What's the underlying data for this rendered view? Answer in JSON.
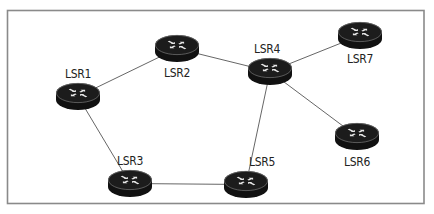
{
  "diagram": {
    "type": "network-topology",
    "node_icon": "router-icon",
    "nodes": [
      {
        "id": "LSR1",
        "label": "LSR1"
      },
      {
        "id": "LSR2",
        "label": "LSR2"
      },
      {
        "id": "LSR3",
        "label": "LSR3"
      },
      {
        "id": "LSR4",
        "label": "LSR4"
      },
      {
        "id": "LSR5",
        "label": "LSR5"
      },
      {
        "id": "LSR6",
        "label": "LSR6"
      },
      {
        "id": "LSR7",
        "label": "LSR7"
      }
    ],
    "edges": [
      {
        "from": "LSR1",
        "to": "LSR2"
      },
      {
        "from": "LSR2",
        "to": "LSR4"
      },
      {
        "from": "LSR4",
        "to": "LSR7"
      },
      {
        "from": "LSR4",
        "to": "LSR6"
      },
      {
        "from": "LSR4",
        "to": "LSR5"
      },
      {
        "from": "LSR1",
        "to": "LSR3"
      },
      {
        "from": "LSR3",
        "to": "LSR5"
      }
    ],
    "colors": {
      "router": "#111111",
      "link": "#555555",
      "frame": "#8a8a8a",
      "label": "#222222"
    }
  }
}
